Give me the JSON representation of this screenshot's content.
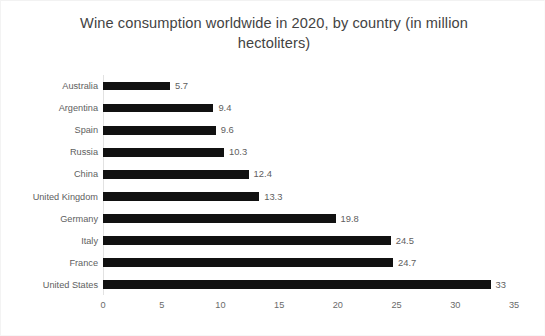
{
  "chart_data": {
    "type": "bar",
    "orientation": "horizontal",
    "title": "Wine consumption worldwide in 2020, by country (in million hectoliters)",
    "xlabel": "",
    "ylabel": "",
    "xlim": [
      0,
      35
    ],
    "xticks": [
      "0",
      "5",
      "10",
      "15",
      "20",
      "25",
      "30",
      "35"
    ],
    "grid": false,
    "legend": null,
    "bar_color": "#111111",
    "label_color": "#5e5e5e",
    "title_color": "#434343",
    "categories": [
      "Australia",
      "Argentina",
      "Spain",
      "Russia",
      "China",
      "United Kingdom",
      "Germany",
      "Italy",
      "France",
      "United States"
    ],
    "values": [
      5.7,
      9.4,
      9.6,
      10.3,
      12.4,
      13.3,
      19.8,
      24.5,
      24.7,
      33
    ],
    "value_labels": [
      "5.7",
      "9.4",
      "9.6",
      "10.3",
      "12.4",
      "13.3",
      "19.8",
      "24.5",
      "24.7",
      "33"
    ]
  }
}
